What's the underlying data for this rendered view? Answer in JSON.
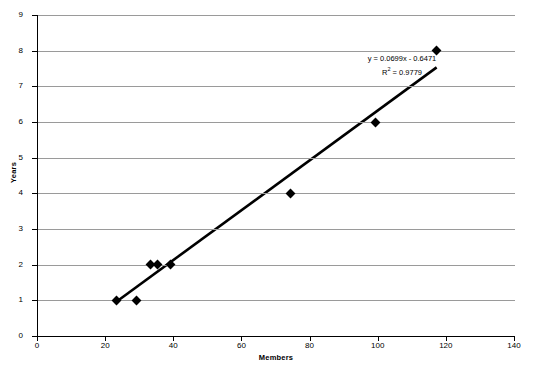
{
  "chart_data": {
    "type": "scatter",
    "title": "",
    "xlabel": "Members",
    "ylabel": "Years",
    "xlim": [
      0,
      140
    ],
    "ylim": [
      0,
      9
    ],
    "xticks": [
      0,
      20,
      40,
      60,
      80,
      100,
      120,
      140
    ],
    "yticks": [
      0,
      1,
      2,
      3,
      4,
      5,
      6,
      7,
      8,
      9
    ],
    "grid": "horizontal",
    "legend": "none",
    "series": [
      {
        "name": "Members vs Years",
        "marker": "diamond",
        "color": "#000000",
        "points": [
          {
            "x": 23,
            "y": 1
          },
          {
            "x": 29,
            "y": 1
          },
          {
            "x": 33,
            "y": 2
          },
          {
            "x": 35,
            "y": 2
          },
          {
            "x": 39,
            "y": 2
          },
          {
            "x": 74,
            "y": 4
          },
          {
            "x": 99,
            "y": 6
          },
          {
            "x": 117,
            "y": 8
          }
        ]
      }
    ],
    "trendline": {
      "type": "linear",
      "slope": 0.0699,
      "intercept": -0.6471,
      "r_squared": 0.9779,
      "color": "#000000",
      "x_start": 23,
      "x_end": 117
    },
    "annotations": {
      "equation": "y = 0.0699x - 0.6471",
      "r_squared_prefix": "R",
      "r_squared_exponent": "2",
      "r_squared_value": " = 0.9779"
    }
  },
  "axes": {
    "x_tick_labels": [
      "0",
      "20",
      "40",
      "60",
      "80",
      "100",
      "120",
      "140"
    ],
    "y_tick_labels": [
      "0",
      "1",
      "2",
      "3",
      "4",
      "5",
      "6",
      "7",
      "8",
      "9"
    ],
    "x_title": "Members",
    "y_title": "Years"
  },
  "colors": {
    "gridline": "#9a9a9a",
    "axis": "#000000",
    "marker": "#000000",
    "trendline": "#000000",
    "background": "#ffffff"
  }
}
